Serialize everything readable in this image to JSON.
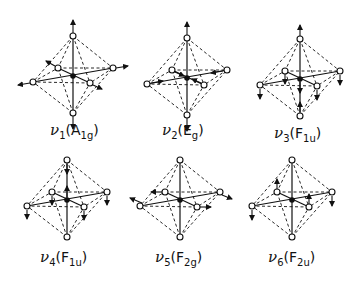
{
  "figure": {
    "modes": [
      {
        "id": "v1",
        "nu": "ν",
        "index": "1",
        "sym": "A",
        "sub": "1g",
        "cx": 73,
        "cy": 76,
        "label_x": 50,
        "label_y": 125,
        "displacement": "radial-all"
      },
      {
        "id": "v2",
        "nu": "ν",
        "index": "2",
        "sym": "E",
        "sub": "g",
        "cx": 187,
        "cy": 78,
        "label_x": 162,
        "label_y": 125,
        "displacement": "axial-out-equatorial-in"
      },
      {
        "id": "v3",
        "nu": "ν",
        "index": "3",
        "sym": "F",
        "sub": "1u",
        "cx": 300,
        "cy": 79,
        "label_x": 274,
        "label_y": 128,
        "displacement": "antisymmetric-stretch"
      },
      {
        "id": "v4",
        "nu": "ν",
        "index": "4",
        "sym": "F",
        "sub": "1u",
        "cx": 67,
        "cy": 200,
        "label_x": 40,
        "label_y": 252,
        "displacement": "bend-down"
      },
      {
        "id": "v5",
        "nu": "ν",
        "index": "5",
        "sym": "F",
        "sub": "2g",
        "cx": 180,
        "cy": 200,
        "label_x": 155,
        "label_y": 252,
        "displacement": "equatorial-scissor"
      },
      {
        "id": "v6",
        "nu": "ν",
        "index": "6",
        "sym": "F",
        "sub": "2u",
        "cx": 292,
        "cy": 200,
        "label_x": 268,
        "label_y": 252,
        "displacement": "bend-down-mixed"
      }
    ]
  },
  "colors": {
    "ink": "#111111",
    "background": "#ffffff"
  }
}
